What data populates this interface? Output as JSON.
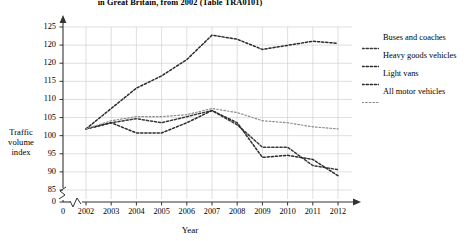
{
  "chart_data": {
    "type": "line",
    "title": "in Great Britain, from 2002 (Table TRA0101)",
    "xlabel": "Year",
    "ylabel": "Traffic volume index",
    "ylabel_lines": [
      "Traffic",
      "volume",
      "index"
    ],
    "grid": true,
    "legend_position": "right",
    "axis_break": true,
    "xlim": [
      2002,
      2012
    ],
    "ylim": [
      85,
      125
    ],
    "x": [
      2002,
      2003,
      2004,
      2005,
      2006,
      2007,
      2008,
      2009,
      2010,
      2011,
      2012
    ],
    "categories": [
      "2002",
      "2003",
      "2004",
      "2005",
      "2006",
      "2007",
      "2008",
      "2009",
      "2010",
      "2011",
      "2012"
    ],
    "xtick_labels": [
      "0",
      "2002",
      "2003",
      "2004",
      "2005",
      "2006",
      "2007",
      "2008",
      "2009",
      "2010",
      "2011",
      "2012"
    ],
    "ytick_labels": [
      "0",
      "85",
      "90",
      "95",
      "100",
      "105",
      "110",
      "115",
      "120",
      "120",
      "125"
    ],
    "ytick_values": [
      85,
      90,
      95,
      100,
      105,
      110,
      115,
      120,
      120,
      125
    ],
    "series": [
      {
        "name": "Buses and coaches",
        "color": "#3a3a3a",
        "values": [
          100,
          101.5,
          102.5,
          101.5,
          103,
          104.5,
          101,
          95.5,
          95.5,
          91,
          90
        ]
      },
      {
        "name": "Heavy goods vehicles",
        "color": "#2b2b2b",
        "values": [
          100,
          101.5,
          99,
          99,
          101.5,
          104.5,
          101.5,
          93,
          93.5,
          92.5,
          88.5
        ]
      },
      {
        "name": "Light vans",
        "color": "#2b2b2b",
        "values": [
          100,
          105,
          110,
          113,
          117,
          123,
          122,
          119.5,
          120.5,
          121.5,
          121
        ]
      },
      {
        "name": "All motor vehicles",
        "color": "#8c8c8c",
        "values": [
          100,
          102,
          103,
          103,
          103.5,
          105,
          104,
          102,
          101.5,
          100.5,
          100
        ]
      }
    ]
  },
  "legend": {
    "items": [
      {
        "label": "Buses and coaches"
      },
      {
        "label": "Heavy goods vehicles"
      },
      {
        "label": "Light vans"
      },
      {
        "label": "All motor vehicles"
      }
    ]
  }
}
